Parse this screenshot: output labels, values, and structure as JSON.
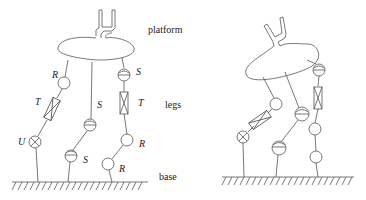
{
  "diagram": {
    "left_figure": {
      "labels": {
        "platform": "platform",
        "legs": "legs",
        "base": "base"
      },
      "joints": {
        "leg1_top": "R",
        "leg1_mid": "T",
        "leg1_bottom": "U",
        "leg2_top": "S",
        "leg2_bottom": "S",
        "leg3_top": "S",
        "leg3_mid": "T",
        "leg3_lower": "R",
        "leg3_bottom": "R"
      }
    },
    "right_figure": {
      "description": "Same mechanism with tilted platform"
    },
    "legend": {
      "R": "revolute joint",
      "T": "prismatic (translational) joint",
      "U": "universal joint",
      "S": "spherical joint"
    }
  }
}
